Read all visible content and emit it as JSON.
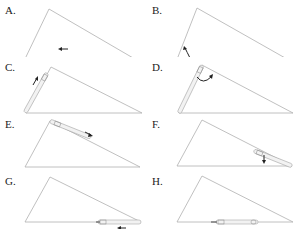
{
  "colors": {
    "triangle_stroke": "#b0b0b0",
    "ruler_fill": "#f2f2f2",
    "ruler_stroke": "#a8a8a8",
    "arrow": "#222222"
  },
  "panels": [
    {
      "label": "A.",
      "description": "Ruler on base at left-center, arrow pointing left"
    },
    {
      "label": "B.",
      "description": "Ruler on base starting at left vertex, curved arrow rotating up toward left side"
    },
    {
      "label": "C.",
      "description": "Ruler along left side, arrow pointing up toward apex"
    },
    {
      "label": "D.",
      "description": "Ruler along left side at apex, curved arrow rotating toward right side"
    },
    {
      "label": "E.",
      "description": "Ruler along right side from apex, arrow pointing down-right"
    },
    {
      "label": "F.",
      "description": "Ruler along right side near right vertex, arrow pointing down"
    },
    {
      "label": "G.",
      "description": "Ruler on base at right vertex, arrow pointing left below"
    },
    {
      "label": "H.",
      "description": "Ruler on base at center"
    }
  ]
}
